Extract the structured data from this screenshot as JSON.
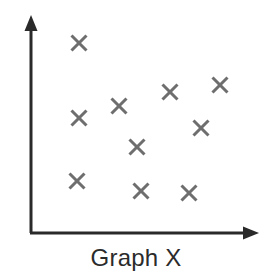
{
  "figure": {
    "caption": "Graph X",
    "caption_color": "#2b2b2b",
    "background_color": "#ffffff"
  },
  "axes": {
    "color": "#2a2a2a",
    "line_width": 3,
    "origin": {
      "x": 31,
      "y": 233
    },
    "y_axis_top": {
      "x": 31,
      "y": 16
    },
    "x_axis_right": {
      "x": 258,
      "y": 233
    },
    "y_arrowhead": "up-arrow",
    "x_arrowhead": "right-arrow",
    "x_tick_labels": [],
    "y_tick_labels": [],
    "grid": false
  },
  "markers": {
    "glyph": "x-marker",
    "color": "#6e6e6e",
    "size": 15,
    "stroke_width": 3,
    "count": 10
  },
  "chart_data": {
    "type": "scatter",
    "title": "Graph X",
    "xlabel": "",
    "ylabel": "",
    "xlim": [
      0,
      100
    ],
    "ylim": [
      0,
      100
    ],
    "grid": false,
    "legend": null,
    "marker": "x",
    "marker_color": "#6e6e6e",
    "series": [
      {
        "name": "points",
        "points": [
          {
            "px": 79,
            "py": 43,
            "x": 21,
            "y": 88
          },
          {
            "px": 220,
            "py": 85,
            "x": 83,
            "y": 68
          },
          {
            "px": 170,
            "py": 92,
            "x": 61,
            "y": 65
          },
          {
            "px": 119,
            "py": 106,
            "x": 39,
            "y": 59
          },
          {
            "px": 79,
            "py": 118,
            "x": 21,
            "y": 53
          },
          {
            "px": 201,
            "py": 128,
            "x": 75,
            "y": 48
          },
          {
            "px": 137,
            "py": 147,
            "x": 47,
            "y": 40
          },
          {
            "px": 77,
            "py": 181,
            "x": 20,
            "y": 24
          },
          {
            "px": 141,
            "py": 191,
            "x": 48,
            "y": 19
          },
          {
            "px": 189,
            "py": 193,
            "x": 70,
            "y": 18
          }
        ]
      }
    ],
    "x": [
      21,
      83,
      61,
      39,
      21,
      75,
      47,
      20,
      48,
      70
    ],
    "y": [
      88,
      68,
      65,
      59,
      53,
      48,
      40,
      24,
      19,
      18
    ]
  }
}
